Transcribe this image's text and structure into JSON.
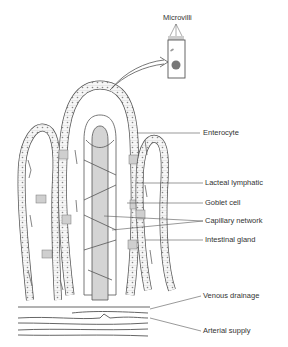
{
  "diagram": {
    "colors": {
      "line": "#555555",
      "fill_shaded": "#d4d4d4",
      "fill_cell": "#f4f4f4",
      "nucleus": "#777777",
      "label_text": "#333333",
      "background": "#ffffff"
    },
    "inset": {
      "label": "Microvilli",
      "description": "Enlarged enterocyte with microvilli on apical surface"
    },
    "labels": [
      {
        "id": "enterocyte",
        "text": "Enterocyte"
      },
      {
        "id": "lacteal",
        "text": "Lacteal lymphatic"
      },
      {
        "id": "goblet",
        "text": "Goblet cell"
      },
      {
        "id": "capillary",
        "text": "Capillary network"
      },
      {
        "id": "gland",
        "text": "Intestinal gland"
      },
      {
        "id": "venous",
        "text": "Venous drainage"
      },
      {
        "id": "arterial",
        "text": "Arterial supply"
      }
    ]
  }
}
